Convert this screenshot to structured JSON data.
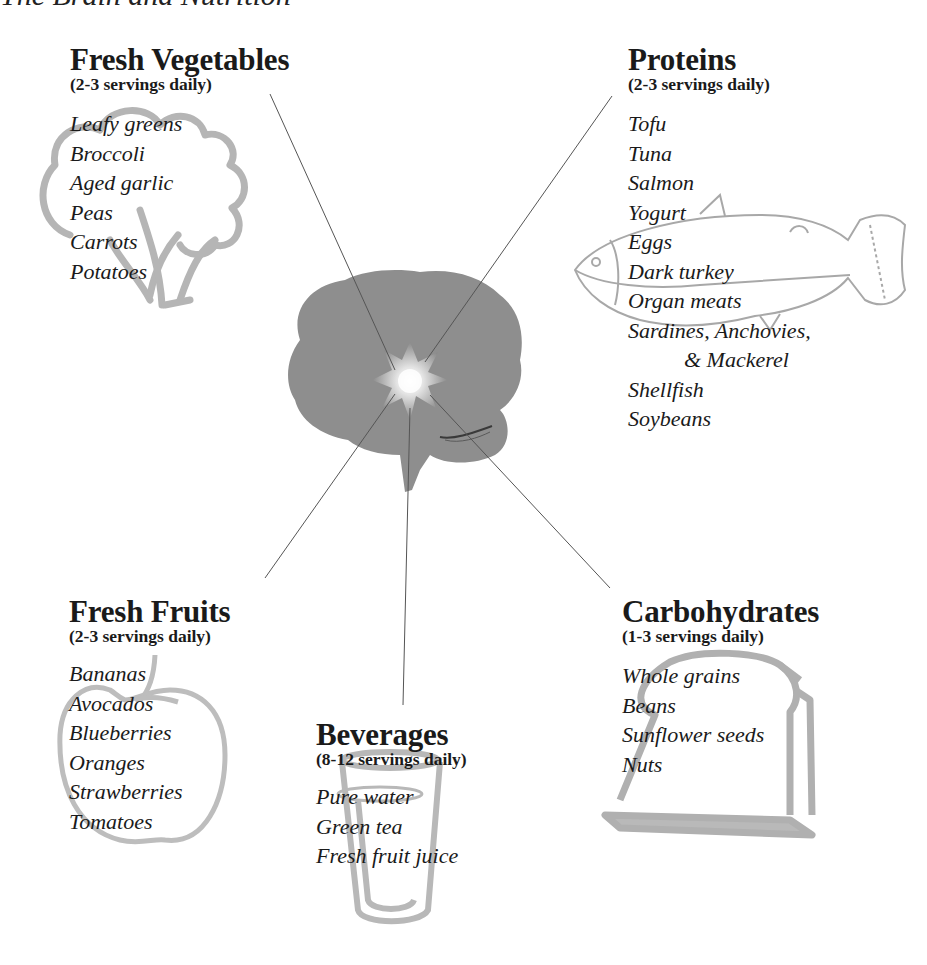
{
  "page": {
    "title": "The Brain and Nutrition"
  },
  "groups": {
    "vegetables": {
      "title": "Fresh Vegetables",
      "servings": "(2-3 servings daily)",
      "illustration": "broccoli-icon",
      "items": [
        "Leafy greens",
        "Broccoli",
        "Aged garlic",
        "Peas",
        "Carrots",
        "Potatoes"
      ]
    },
    "proteins": {
      "title": "Proteins",
      "servings": "(2-3 servings daily)",
      "illustration": "fish-icon",
      "items": [
        "Tofu",
        "Tuna",
        "Salmon",
        "Yogurt",
        "Eggs",
        "Dark turkey",
        "Organ meats",
        "Sardines, Anchovies,",
        "& Mackerel",
        "Shellfish",
        "Soybeans"
      ]
    },
    "fruits": {
      "title": "Fresh Fruits",
      "servings": "(2-3 servings daily)",
      "illustration": "apple-icon",
      "items": [
        "Bananas",
        "Avocados",
        "Blueberries",
        "Oranges",
        "Strawberries",
        "Tomatoes"
      ]
    },
    "beverages": {
      "title": "Beverages",
      "servings": "(8-12 servings daily)",
      "illustration": "glass-icon",
      "items": [
        "Pure water",
        "Green tea",
        "Fresh fruit juice"
      ]
    },
    "carbohydrates": {
      "title": "Carbohydrates",
      "servings": "(1-3 servings daily)",
      "illustration": "bread-slice-icon",
      "items": [
        "Whole grains",
        "Beans",
        "Sunflower seeds",
        "Nuts"
      ]
    }
  },
  "center": {
    "illustration": "brain-icon",
    "highlight": "starburst-icon"
  },
  "colors": {
    "text": "#1a1a1a",
    "brain": "#8c8c8c",
    "illustration": "#b3b3b3",
    "connector": "#555555"
  }
}
